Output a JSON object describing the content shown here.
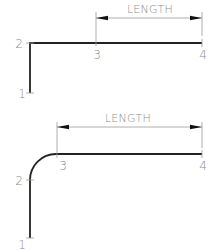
{
  "diagram": {
    "top": {
      "dimension_label": "LENGTH",
      "points": [
        {
          "id": "p1",
          "label": "1"
        },
        {
          "id": "p2",
          "label": "2"
        },
        {
          "id": "p3",
          "label": "3"
        },
        {
          "id": "p4",
          "label": "4"
        }
      ],
      "corner": "sharp"
    },
    "bottom": {
      "dimension_label": "LENGTH",
      "points": [
        {
          "id": "p1",
          "label": "1"
        },
        {
          "id": "p2",
          "label": "2"
        },
        {
          "id": "p3",
          "label": "3"
        },
        {
          "id": "p4",
          "label": "4"
        }
      ],
      "corner": "filleted"
    },
    "colors": {
      "geometry": "#222222",
      "dimension": "#9a9a9a",
      "text": "#8c8c8c",
      "arrowhead": "#111111"
    }
  }
}
